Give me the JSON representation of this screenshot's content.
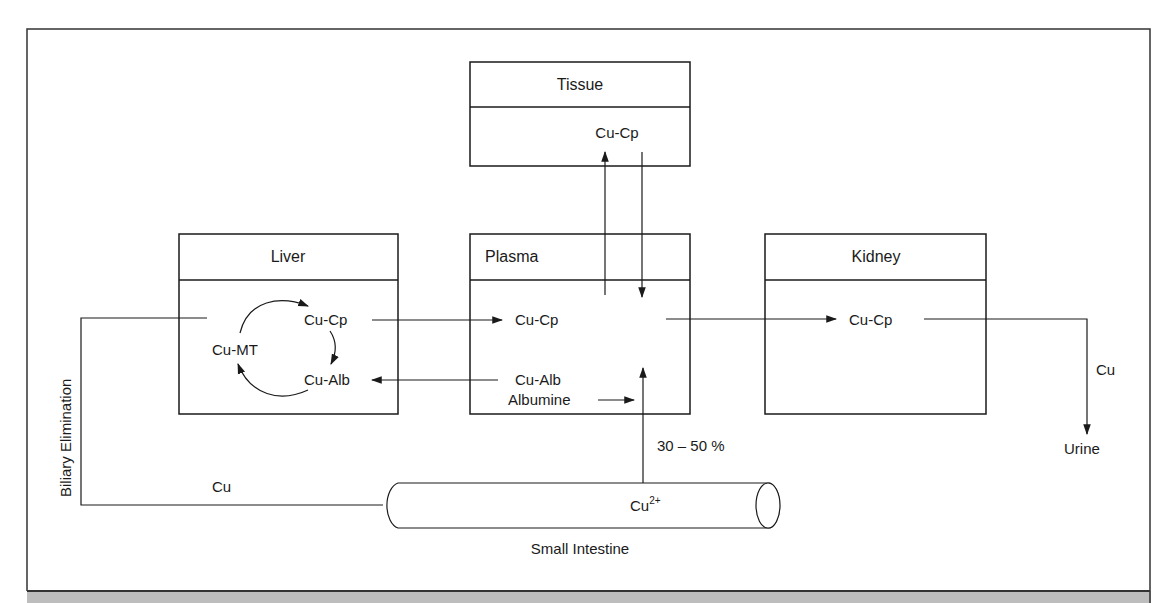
{
  "diagram": {
    "type": "copper metabolism flow diagram",
    "compartments": {
      "tissue": {
        "title": "Tissue",
        "species": "Cu-Cp"
      },
      "liver": {
        "title": "Liver",
        "species": [
          "Cu-Cp",
          "Cu-MT",
          "Cu-Alb"
        ]
      },
      "plasma": {
        "title": "Plasma",
        "species": [
          "Cu-Cp",
          "Cu-Alb",
          "Albumine"
        ]
      },
      "kidney": {
        "title": "Kidney",
        "species": "Cu-Cp"
      },
      "intestine": {
        "title": "Small Intestine",
        "species_base": "Cu",
        "species_charge": "2+"
      }
    },
    "labels": {
      "biliary": "Biliary Elimination",
      "biliary_cu": "Cu",
      "urine_cu": "Cu",
      "urine": "Urine",
      "absorption": "30 – 50 %"
    },
    "flows": [
      {
        "from": "Liver Cu-Cp",
        "to": "Plasma Cu-Cp"
      },
      {
        "from": "Plasma Cu-Alb",
        "to": "Liver Cu-Alb"
      },
      {
        "from": "Plasma",
        "to": "Tissue Cu-Cp"
      },
      {
        "from": "Tissue Cu-Cp",
        "to": "Plasma"
      },
      {
        "from": "Plasma",
        "to": "Kidney Cu-Cp"
      },
      {
        "from": "Kidney Cu-Cp",
        "to": "Urine",
        "label": "Cu"
      },
      {
        "from": "Small Intestine Cu2+",
        "to": "Plasma",
        "label": "30 – 50 %"
      },
      {
        "from": "Albumine",
        "to": "Plasma"
      },
      {
        "from": "Liver",
        "to": "Small Intestine",
        "label": "Cu (Biliary Elimination)"
      },
      {
        "from": "Cu-Cp",
        "to": "Cu-Alb",
        "cycle": "liver"
      },
      {
        "from": "Cu-Alb",
        "to": "Cu-MT",
        "cycle": "liver"
      },
      {
        "from": "Cu-MT",
        "to": "Cu-Cp",
        "cycle": "liver"
      }
    ],
    "colors": {
      "line": "#1a1a1a",
      "background": "#ffffff",
      "footer_band": "#bdbdbd"
    }
  }
}
